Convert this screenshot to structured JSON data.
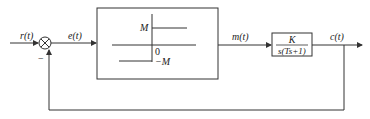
{
  "diagram": {
    "type": "feedback-control-block-diagram",
    "signals": {
      "input": "r(t)",
      "error": "e(t)",
      "control": "m(t)",
      "output": "c(t)"
    },
    "summing_junction": {
      "feedback_sign": "−"
    },
    "nonlinear_block": {
      "description": "ideal relay",
      "upper_level": "M",
      "lower_level": "−M",
      "origin": "0"
    },
    "plant_block": {
      "numerator": "K",
      "denominator": "s(Ts+1)"
    },
    "colors": {
      "line": "#333333",
      "block_fill": "#ffffff"
    }
  }
}
